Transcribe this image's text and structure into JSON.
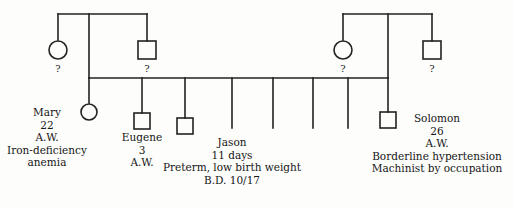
{
  "diagram": {
    "stroke_color": "#222222",
    "background_color": "#fdfdfc",
    "text_color": "#161616"
  },
  "generation1": {
    "left_couple": {
      "female": {
        "symbol": "circle",
        "label": "?"
      },
      "male": {
        "symbol": "square",
        "label": "?"
      }
    },
    "right_couple": {
      "female": {
        "symbol": "circle",
        "label": "?"
      },
      "male": {
        "symbol": "square",
        "label": "?"
      }
    }
  },
  "parents": {
    "mother": {
      "symbol": "circle",
      "name": "Mary",
      "age": "22",
      "initials": "A.W.",
      "condition_line1": "Iron-deficiency",
      "condition_line2": "anemia"
    },
    "father": {
      "symbol": "square",
      "name": "Solomon",
      "age": "26",
      "initials": "A.W.",
      "condition": "Borderline hypertension",
      "occupation": "Machinist by occupation"
    }
  },
  "children": [
    {
      "symbol": "square",
      "name": "Eugene",
      "age": "3",
      "initials": "A.W."
    },
    {
      "symbol": "square",
      "name": "Jason",
      "age": "11 days",
      "condition": "Preterm, low birth weight",
      "birth_date": "B.D. 10/17"
    }
  ],
  "unlabeled_siblings_count": "5"
}
